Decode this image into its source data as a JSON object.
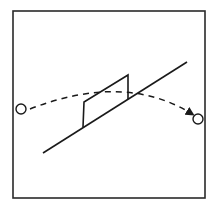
{
  "diagram": {
    "colors": {
      "background": "#ffffff",
      "stroke": "#1a1a1a",
      "frame": "#2a2a2a"
    },
    "elements": {
      "frame": "border",
      "start_object": "circle",
      "end_object": "circle",
      "ramp": "inclined line",
      "obstacle": "parallelogram block",
      "trajectory": "dashed curve with arrow"
    }
  }
}
